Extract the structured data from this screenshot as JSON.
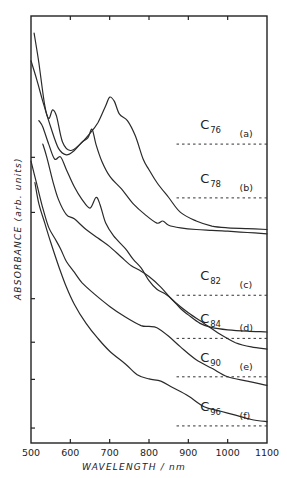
{
  "chart_data": {
    "type": "line",
    "title": "",
    "xlabel": "WAVELENGTH / nm",
    "ylabel": "ABSORBANCE (arb. units)",
    "xlim": [
      500,
      1100
    ],
    "xticks": [
      500,
      600,
      700,
      800,
      900,
      1000,
      1100
    ],
    "xtick_labels": [
      "500",
      "600",
      "700",
      "800",
      "900",
      "1000",
      "1100"
    ],
    "ylim": [
      0,
      100
    ],
    "y_units": "arbitrary (offset stacked spectra, 0 = bottom of frame, 100 = top)",
    "y_tick_levels": [
      66.9,
      54.0,
      33.8,
      23.6,
      14.9,
      3.5
    ],
    "grid": false,
    "legend": "inline labels at right",
    "series": [
      {
        "name": "C76",
        "base": "C",
        "subscript": "76",
        "tag": "(a)",
        "baseline": 70.0,
        "x": [
          508,
          520,
          535,
          545,
          555,
          565,
          580,
          600,
          625,
          650,
          670,
          690,
          700,
          712,
          725,
          745,
          765,
          785,
          800,
          820,
          850,
          880,
          920,
          960,
          1000,
          1050,
          1100
        ],
        "y": [
          96.0,
          89.0,
          79.0,
          76.0,
          78.0,
          76.5,
          70.5,
          68.5,
          70.0,
          72.5,
          75.0,
          79.0,
          81.0,
          80.0,
          77.0,
          75.5,
          72.0,
          66.5,
          64.0,
          61.0,
          57.5,
          54.0,
          52.0,
          50.8,
          50.4,
          50.2,
          50.0
        ]
      },
      {
        "name": "C78",
        "base": "C",
        "subscript": "78",
        "tag": "(b)",
        "baseline": 57.4,
        "x": [
          500,
          515,
          530,
          550,
          570,
          590,
          610,
          630,
          645,
          655,
          665,
          680,
          700,
          730,
          760,
          790,
          820,
          835,
          850,
          880,
          920,
          960,
          1000,
          1050,
          1100
        ],
        "y": [
          89.5,
          85.0,
          80.0,
          74.0,
          69.0,
          67.5,
          68.5,
          70.5,
          71.5,
          73.5,
          70.0,
          66.0,
          62.5,
          59.5,
          56.0,
          53.5,
          51.5,
          52.0,
          51.0,
          50.4,
          50.0,
          49.8,
          49.6,
          49.3,
          49.0
        ]
      },
      {
        "name": "C82",
        "base": "C",
        "subscript": "82",
        "tag": "(c)",
        "baseline": 34.6,
        "x": [
          520,
          530,
          545,
          560,
          575,
          590,
          610,
          630,
          650,
          665,
          675,
          690,
          710,
          740,
          760,
          780,
          800,
          820,
          840,
          860,
          880,
          900,
          930,
          960,
          1000,
          1050,
          1100
        ],
        "y": [
          75.5,
          74.0,
          70.0,
          66.5,
          67.0,
          64.0,
          60.0,
          57.0,
          55.0,
          57.5,
          56.0,
          51.5,
          48.5,
          45.5,
          43.0,
          41.0,
          38.0,
          36.0,
          35.0,
          33.5,
          31.5,
          30.0,
          28.0,
          27.0,
          26.5,
          26.2,
          26.0
        ]
      },
      {
        "name": "C84",
        "base": "C",
        "subscript": "84",
        "tag": "(d)",
        "baseline": 24.5,
        "x": [
          530,
          540,
          555,
          570,
          590,
          610,
          640,
          670,
          700,
          730,
          755,
          775,
          800,
          830,
          860,
          900,
          940,
          980,
          1020,
          1060,
          1100
        ],
        "y": [
          70.0,
          67.0,
          61.5,
          57.0,
          53.5,
          52.5,
          50.0,
          48.0,
          46.0,
          43.5,
          41.5,
          40.5,
          39.0,
          36.5,
          33.5,
          30.5,
          28.0,
          25.5,
          23.5,
          22.5,
          22.0
        ]
      },
      {
        "name": "C90",
        "base": "C",
        "subscript": "90",
        "tag": "(e)",
        "baseline": 15.5,
        "x": [
          500,
          515,
          530,
          545,
          560,
          575,
          590,
          610,
          630,
          660,
          700,
          740,
          780,
          800,
          820,
          850,
          880,
          920,
          960,
          1000,
          1050,
          1100
        ],
        "y": [
          66.0,
          60.5,
          55.0,
          50.5,
          48.0,
          45.5,
          42.5,
          40.0,
          37.5,
          35.0,
          32.0,
          29.5,
          27.5,
          27.3,
          27.0,
          25.0,
          22.5,
          19.5,
          17.5,
          15.5,
          14.5,
          13.5
        ]
      },
      {
        "name": "C96",
        "base": "C",
        "subscript": "96",
        "tag": "(f)",
        "baseline": 4.0,
        "x": [
          510,
          520,
          535,
          550,
          570,
          590,
          610,
          640,
          670,
          700,
          740,
          770,
          800,
          830,
          860,
          900,
          940,
          980,
          1020,
          1060,
          1100
        ],
        "y": [
          61.0,
          56.0,
          51.5,
          47.0,
          41.5,
          36.5,
          32.5,
          28.0,
          24.5,
          21.5,
          18.5,
          16.0,
          15.0,
          14.5,
          13.0,
          11.0,
          8.5,
          7.5,
          6.5,
          5.5,
          5.0
        ]
      }
    ]
  }
}
